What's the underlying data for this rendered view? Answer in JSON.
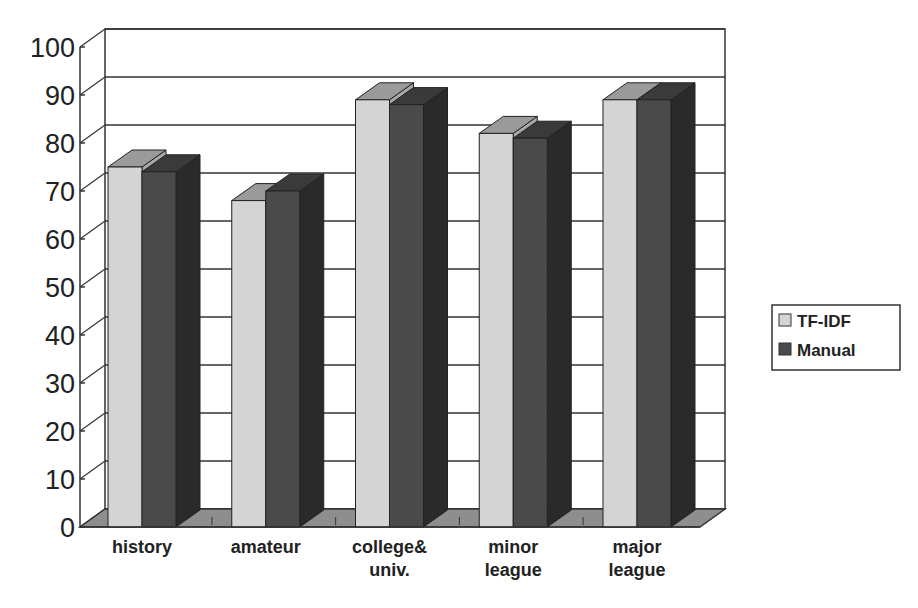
{
  "chart_data": {
    "type": "bar",
    "style": "3d-clustered-column",
    "title": "",
    "xlabel": "",
    "ylabel": "",
    "ylim": [
      0,
      100
    ],
    "yticks": [
      0,
      10,
      20,
      30,
      40,
      50,
      60,
      70,
      80,
      90,
      100
    ],
    "categories": [
      "history",
      "amateur",
      "college& univ.",
      "minor league",
      "major league"
    ],
    "category_lines": [
      [
        "history"
      ],
      [
        "amateur"
      ],
      [
        "college&",
        "univ."
      ],
      [
        "minor",
        "league"
      ],
      [
        "major",
        "league"
      ]
    ],
    "series": [
      {
        "name": "TF-IDF",
        "values": [
          75,
          68,
          89,
          82,
          89
        ],
        "color": "#d4d4d4",
        "top": "#9a9a9a",
        "side": "#a8a8a8"
      },
      {
        "name": "Manual",
        "values": [
          74,
          70,
          88,
          81,
          89
        ],
        "color": "#4a4a4a",
        "top": "#3a3a3a",
        "side": "#2a2a2a"
      }
    ],
    "grid": true,
    "legend_position": "right"
  },
  "legend": {
    "items": [
      {
        "label": "TF-IDF"
      },
      {
        "label": "Manual"
      }
    ]
  }
}
